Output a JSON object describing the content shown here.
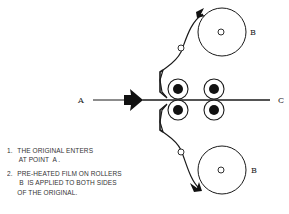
{
  "diagram": {
    "labels": {
      "entry_point": "A",
      "exit_point": "C",
      "top_film_roller": "B",
      "bottom_film_roller": "B"
    },
    "colors": {
      "stroke": "#1a1a1a",
      "background": "#ffffff"
    }
  },
  "notes": [
    {
      "number": "1.",
      "text": "THE ORIGINAL ENTERS\n AT POINT  A ."
    },
    {
      "number": "2.",
      "text": "PRE-HEATED FILM ON ROLLERS\n B  IS APPLIED TO BOTH SIDES\nOF THE ORIGINAL."
    }
  ]
}
